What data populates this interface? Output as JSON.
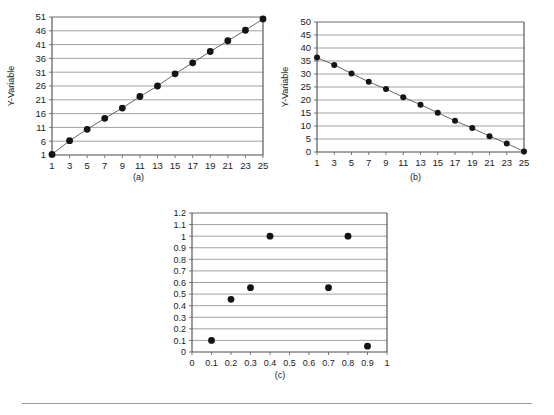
{
  "figure": {
    "background": "#ffffff",
    "marker_color": "#141414",
    "line_color": "#555555",
    "grid_color": "#8a8a8a",
    "axis_color": "#4a4a4a",
    "footer_rule": true
  },
  "panels": [
    {
      "id": "a",
      "caption": "(a)"
    },
    {
      "id": "b",
      "caption": "(b)"
    },
    {
      "id": "c",
      "caption": "(c)"
    }
  ],
  "chart_data": [
    {
      "id": "a",
      "type": "line",
      "title": "",
      "xlabel": "",
      "ylabel": "Y-Variable",
      "grid": true,
      "legend": "none",
      "xlim": [
        1,
        25
      ],
      "ylim": [
        1,
        51
      ],
      "xticks": [
        1,
        3,
        5,
        7,
        9,
        11,
        13,
        15,
        17,
        19,
        21,
        23,
        25
      ],
      "xtick_labels": [
        "1",
        "3",
        "5",
        "7",
        "9",
        "11",
        "13",
        "15",
        "17",
        "19",
        "21",
        "23",
        "25"
      ],
      "yticks": [
        1,
        6,
        11,
        16,
        21,
        26,
        31,
        36,
        41,
        46,
        51
      ],
      "ytick_labels": [
        "1",
        "6",
        "11",
        "16",
        "21",
        "26",
        "31",
        "36",
        "41",
        "46",
        "51"
      ],
      "x": [
        1,
        3,
        5,
        7,
        9,
        11,
        13,
        15,
        17,
        19,
        21,
        23,
        25
      ],
      "values": [
        1.2,
        6.2,
        10.3,
        14.3,
        18.0,
        22.2,
        26.0,
        30.4,
        34.4,
        38.5,
        42.4,
        46.2,
        50.3
      ]
    },
    {
      "id": "b",
      "type": "line",
      "title": "",
      "xlabel": "",
      "ylabel": "Y-Variable",
      "grid": true,
      "legend": "none",
      "xlim": [
        1,
        25
      ],
      "ylim": [
        0,
        50
      ],
      "xticks": [
        1,
        3,
        5,
        7,
        9,
        11,
        13,
        15,
        17,
        19,
        21,
        23,
        25
      ],
      "xtick_labels": [
        "1",
        "3",
        "5",
        "7",
        "9",
        "11",
        "13",
        "15",
        "17",
        "19",
        "21",
        "23",
        "25"
      ],
      "yticks": [
        0,
        5,
        10,
        15,
        20,
        25,
        30,
        35,
        40,
        45,
        50
      ],
      "ytick_labels": [
        "0",
        "5",
        "10",
        "15",
        "20",
        "25",
        "30",
        "35",
        "40",
        "45",
        "50"
      ],
      "x": [
        1,
        3,
        5,
        7,
        9,
        11,
        13,
        15,
        17,
        19,
        21,
        23,
        25
      ],
      "values": [
        36.3,
        33.5,
        30.2,
        27.0,
        24.2,
        21.1,
        18.2,
        15.1,
        12.0,
        9.2,
        6.1,
        3.3,
        0.2
      ]
    },
    {
      "id": "c",
      "type": "scatter",
      "title": "",
      "xlabel": "",
      "ylabel": "",
      "grid": true,
      "legend": "none",
      "xlim": [
        0,
        1
      ],
      "ylim": [
        0,
        1.2
      ],
      "xticks": [
        0,
        0.1,
        0.2,
        0.3,
        0.4,
        0.5,
        0.6,
        0.7,
        0.8,
        0.9,
        1
      ],
      "xtick_labels": [
        "0",
        "0.1",
        "0.2",
        "0.3",
        "0.4",
        "0.5",
        "0.6",
        "0.7",
        "0.8",
        "0.9",
        "1"
      ],
      "yticks": [
        0,
        0.1,
        0.2,
        0.3,
        0.4,
        0.5,
        0.6,
        0.7,
        0.8,
        0.9,
        1,
        1.1,
        1.2
      ],
      "ytick_labels": [
        "0",
        "0.1",
        "0.2",
        "0.3",
        "0.4",
        "0.5",
        "0.6",
        "0.7",
        "0.8",
        "0.9",
        "1",
        "1.1",
        "1.2"
      ],
      "x": [
        0.1,
        0.2,
        0.3,
        0.4,
        0.7,
        0.8,
        0.9
      ],
      "values": [
        0.1,
        0.455,
        0.555,
        1.0,
        0.555,
        1.0,
        0.05
      ]
    }
  ]
}
